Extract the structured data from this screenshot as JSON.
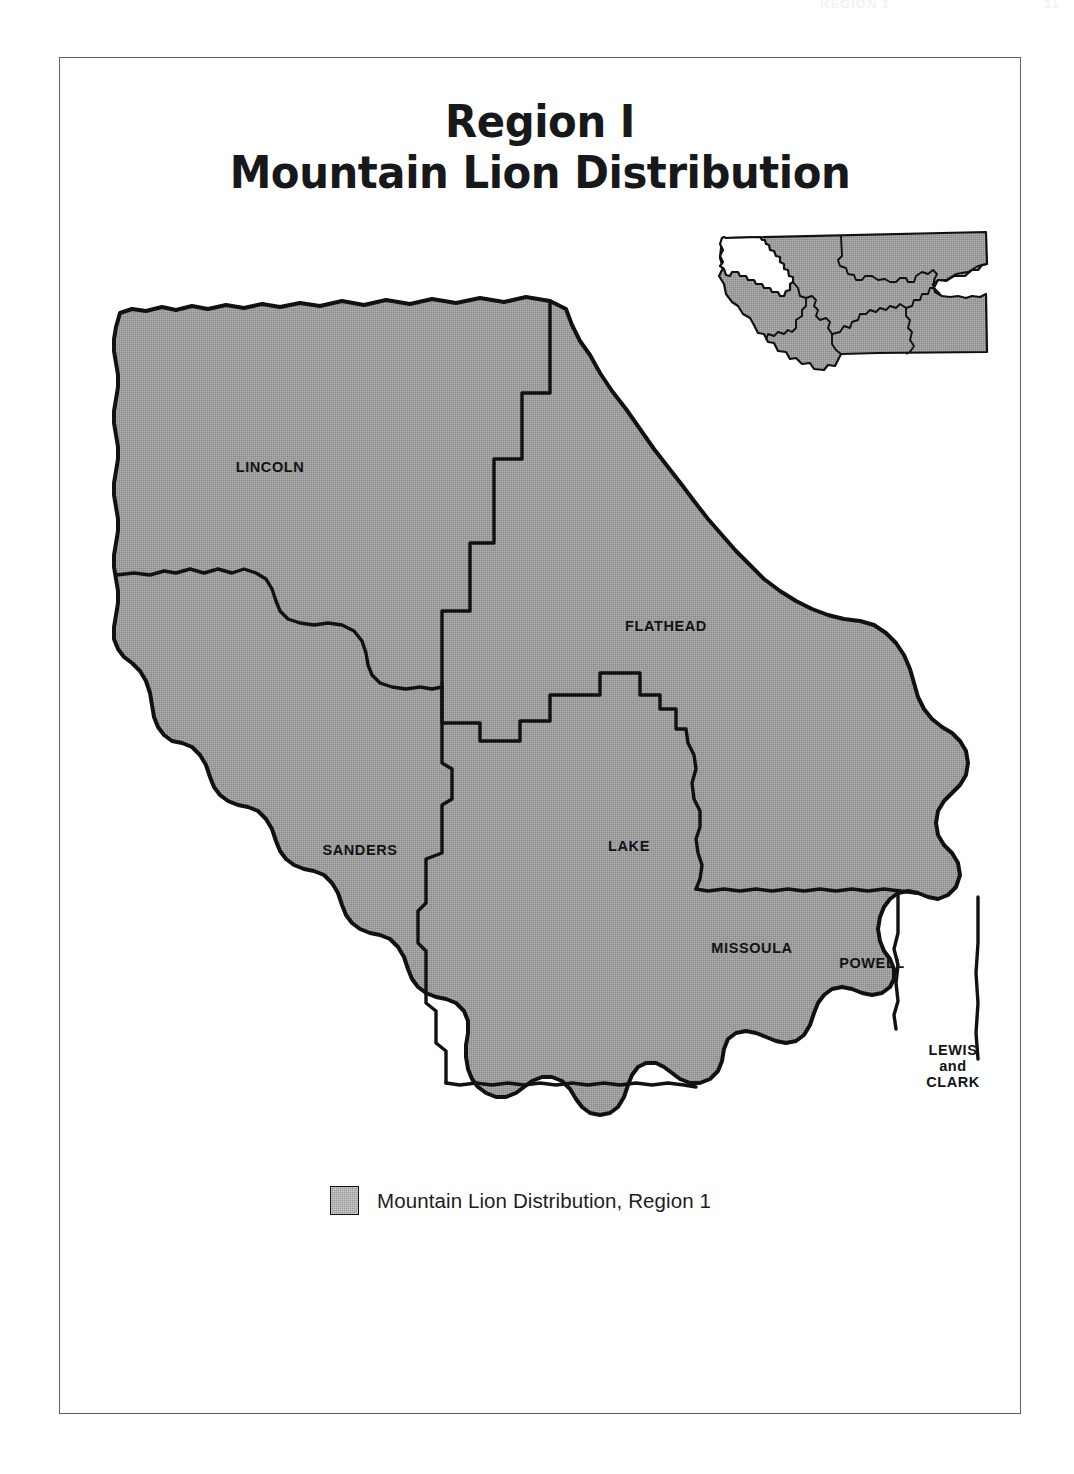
{
  "running_head": {
    "left": "REGION 1",
    "right": "11"
  },
  "title": {
    "line1": "Region I",
    "line2": "Mountain Lion Distribution"
  },
  "legend": {
    "swatch_name": "distribution-swatch",
    "label": "Mountain Lion Distribution, Region 1",
    "swatch_color": "#9a9a9a",
    "swatch_border_color": "#111111"
  },
  "map": {
    "fill_color": "#9a9a9a",
    "outline_color": "#111111",
    "background_color": "#ffffff",
    "counties": [
      {
        "name": "LINCOLN",
        "label": "LINCOLN",
        "x": 268,
        "y": 466
      },
      {
        "name": "FLATHEAD",
        "label": "FLATHEAD",
        "x": 664,
        "y": 625
      },
      {
        "name": "SANDERS",
        "label": "SANDERS",
        "x": 358,
        "y": 849
      },
      {
        "name": "LAKE",
        "label": "LAKE",
        "x": 627,
        "y": 845
      },
      {
        "name": "MISSOULA",
        "label": "MISSOULA",
        "x": 750,
        "y": 947
      },
      {
        "name": "POWELL",
        "label": "POWELL",
        "x": 870,
        "y": 962
      }
    ],
    "lewis_and_clark": {
      "line1": "LEWIS",
      "line2": "and",
      "line3": "CLARK",
      "x": 951,
      "y": 1065
    }
  },
  "inset": {
    "name": "montana-state-locator",
    "highlight_region": "Region 1",
    "highlight_fill": "#ffffff",
    "other_fill": "#9a9a9a",
    "outline_color": "#111111"
  }
}
